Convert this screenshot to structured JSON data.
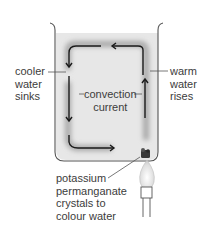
{
  "diagram": {
    "labels": {
      "cooler": "cooler\nwater\nsinks",
      "warm": "warm\nwater\nrises",
      "convection": "convection\ncurrent",
      "crystals": "potassium\npermanganate\ncrystals to\ncolour water"
    },
    "colors": {
      "water": "#e6e6e6",
      "beaker_outline": "#555555",
      "arrow": "#1a1a1a",
      "glow": "#9a9a9a",
      "crystals": "#3a3a3a",
      "flame": "#cfcfcf"
    }
  }
}
